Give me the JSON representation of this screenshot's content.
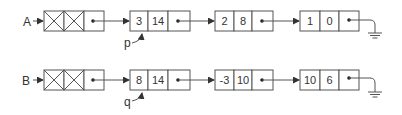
{
  "diagram": {
    "type": "linked-lists",
    "colors": {
      "stroke": "#555555",
      "text": "#333333",
      "background": "#ffffff"
    },
    "lists": [
      {
        "head_label": "A",
        "header_node": {
          "cells": [
            "X",
            "X",
            "next"
          ]
        },
        "nodes": [
          {
            "coef": "3",
            "exp": "14"
          },
          {
            "coef": "2",
            "exp": "8"
          },
          {
            "coef": "1",
            "exp": "0"
          }
        ],
        "pointer": {
          "label": "p",
          "points_to_node": 0
        },
        "terminator": "ground-null"
      },
      {
        "head_label": "B",
        "header_node": {
          "cells": [
            "X",
            "X",
            "next"
          ]
        },
        "nodes": [
          {
            "coef": "8",
            "exp": "14"
          },
          {
            "coef": "-3",
            "exp": "10"
          },
          {
            "coef": "10",
            "exp": "6"
          }
        ],
        "pointer": {
          "label": "q",
          "points_to_node": 0
        },
        "terminator": "ground-null"
      }
    ]
  }
}
